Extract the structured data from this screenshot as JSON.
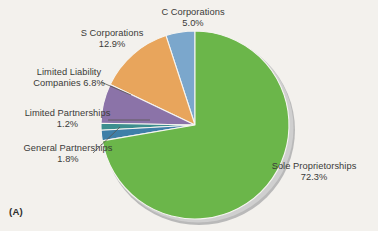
{
  "figure": {
    "panel_tag": "(A)",
    "background_color": "#f3f1ed",
    "text_color": "#3a3a38"
  },
  "chart_data": {
    "type": "pie",
    "title": "",
    "subtitle": "",
    "xlabel": "",
    "ylabel": "",
    "legend_position": "none",
    "grid": false,
    "units": "percent",
    "total": 100.0,
    "start_angle_deg": 90,
    "direction": "counterclockwise",
    "categories": [
      "C Corporations",
      "S Corporations",
      "Limited Liability Companies",
      "Limited Partnerships",
      "General Partnerships",
      "Sole Proprietorships"
    ],
    "values": [
      5.0,
      12.9,
      6.8,
      1.2,
      1.8,
      72.3
    ],
    "colors": [
      "#7ba7cc",
      "#e8a55c",
      "#8b73a8",
      "#3d8e8e",
      "#3e7fa8",
      "#6bb64a"
    ],
    "slices": [
      {
        "name": "C Corporations",
        "value": 5.0,
        "color": "#7ba7cc",
        "label_line1": "C Corporations",
        "label_line2": "5.0%",
        "leader_line": false
      },
      {
        "name": "S Corporations",
        "value": 12.9,
        "color": "#e8a55c",
        "label_line1": "S Corporations",
        "label_line2": "12.9%",
        "leader_line": false
      },
      {
        "name": "Limited Liability Companies",
        "value": 6.8,
        "color": "#8b73a8",
        "label_line1": "Limited Liability",
        "label_line2": "Companies 6.8%",
        "leader_line": true
      },
      {
        "name": "Limited Partnerships",
        "value": 1.2,
        "color": "#3d8e8e",
        "label_line1": "Limited Partnerships",
        "label_line2": "1.2%",
        "leader_line": true
      },
      {
        "name": "General Partnerships",
        "value": 1.8,
        "color": "#3e7fa8",
        "label_line1": "General Partnerships",
        "label_line2": "1.8%",
        "leader_line": true
      },
      {
        "name": "Sole Proprietorships",
        "value": 72.3,
        "color": "#6bb64a",
        "label_line1": "Sole Proprietorships",
        "label_line2": "72.3%",
        "leader_line": false
      }
    ]
  }
}
